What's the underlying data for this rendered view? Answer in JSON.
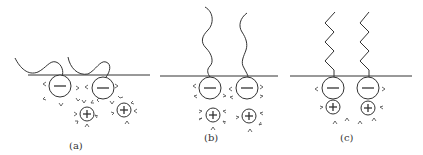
{
  "figure": {
    "panels": [
      {
        "id": "a",
        "caption": "(a)",
        "tail_shape": "curly-lying",
        "headgroups": [
          {
            "charge": "-"
          },
          {
            "charge": "-"
          }
        ],
        "counterions": [
          {
            "charge": "+"
          },
          {
            "charge": "+"
          }
        ]
      },
      {
        "id": "b",
        "caption": "(b)",
        "tail_shape": "wavy-upright",
        "headgroups": [
          {
            "charge": "-"
          },
          {
            "charge": "-"
          }
        ],
        "counterions": [
          {
            "charge": "+"
          },
          {
            "charge": "+"
          }
        ]
      },
      {
        "id": "c",
        "caption": "(c)",
        "tail_shape": "zigzag-upright",
        "headgroups": [
          {
            "charge": "-"
          },
          {
            "charge": "-"
          }
        ],
        "counterions": [
          {
            "charge": "+"
          },
          {
            "charge": "+"
          }
        ]
      }
    ],
    "colors": {
      "line": "#333333",
      "background": "#ffffff"
    }
  }
}
